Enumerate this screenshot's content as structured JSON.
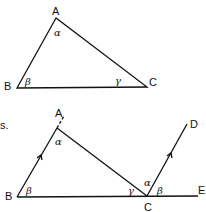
{
  "figure1": {
    "vertices": {
      "A": "A",
      "B": "B",
      "C": "C"
    },
    "angles": {
      "at_A": "α",
      "at_B": "β",
      "at_C": "γ"
    }
  },
  "figure2": {
    "stray_label": "s.",
    "vertices": {
      "A": "A",
      "B": "B",
      "C": "C",
      "D": "D",
      "E": "E"
    },
    "angles": {
      "at_A": "α",
      "at_B": "β",
      "at_C_inner": "γ",
      "at_C_upper": "α",
      "at_C_right": "β"
    }
  }
}
